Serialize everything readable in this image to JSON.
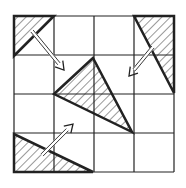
{
  "diagram": {
    "type": "grid-puzzle",
    "grid": {
      "rows": 4,
      "cols": 4,
      "x0": 14,
      "y0": 16,
      "x1": 174,
      "y1": 172
    },
    "colors": {
      "line": "#222222",
      "hatch": "#333333",
      "background": "#ffffff"
    },
    "triangles": [
      {
        "name": "top-left-triangle",
        "points": "14,16 54,16 14,56"
      },
      {
        "name": "top-right-triangle",
        "points": "134,16 174,16 174,93"
      },
      {
        "name": "center-triangle",
        "points": "93,58 54,94 132,132"
      },
      {
        "name": "bottom-left-triangle",
        "points": "14,134 14,172 93,172"
      }
    ],
    "arrows": [
      {
        "name": "arrow-top-left-to-center",
        "from": [
          32,
          31
        ],
        "to": [
          64,
          70
        ]
      },
      {
        "name": "arrow-top-right-to-center",
        "from": [
          153,
          47
        ],
        "to": [
          129,
          76
        ]
      },
      {
        "name": "arrow-bottom-left-to-center",
        "from": [
          42,
          155
        ],
        "to": [
          73,
          124
        ]
      }
    ]
  }
}
